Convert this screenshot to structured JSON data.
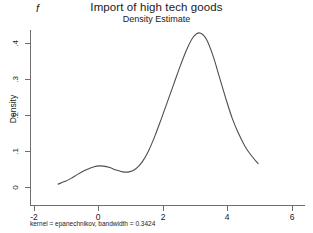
{
  "panel": {
    "letter": "f"
  },
  "titles": {
    "main": "Import of high tech goods",
    "sub": "Density Estimate"
  },
  "note": "kernel = epanechnikov, bandwidth = 0.3424",
  "chart_data": {
    "type": "line",
    "title": "Import of high tech goods",
    "subtitle": "Density Estimate",
    "xlabel": "",
    "ylabel": "Density",
    "xlim": [
      -2.4,
      6.4
    ],
    "ylim": [
      0,
      0.46
    ],
    "xticks": [
      -2,
      0,
      2,
      4,
      6
    ],
    "xticklabels": [
      "-2",
      "0",
      "2",
      "4",
      "6"
    ],
    "yticks": [
      0,
      0.1,
      0.2,
      0.3,
      0.4
    ],
    "yticklabels": [
      "0",
      ".1",
      ".2",
      ".3",
      ".4"
    ],
    "grid": false,
    "legend": false,
    "annotations": [
      "f",
      "kernel = epanechnikov, bandwidth = 0.3424"
    ],
    "series": [
      {
        "name": "Density Estimate",
        "kernel": "epanechnikov",
        "bandwidth": 0.3424,
        "x": [
          -1.25,
          -1.05,
          -0.85,
          -0.65,
          -0.45,
          -0.25,
          -0.05,
          0.15,
          0.35,
          0.55,
          0.75,
          0.95,
          1.15,
          1.35,
          1.55,
          1.75,
          1.95,
          2.15,
          2.35,
          2.55,
          2.75,
          2.95,
          3.15,
          3.35,
          3.55,
          3.75,
          3.95,
          4.15,
          4.35,
          4.55,
          4.75,
          4.95
        ],
        "y": [
          0.008,
          0.015,
          0.024,
          0.035,
          0.045,
          0.053,
          0.058,
          0.058,
          0.054,
          0.047,
          0.042,
          0.042,
          0.05,
          0.069,
          0.1,
          0.142,
          0.19,
          0.24,
          0.29,
          0.34,
          0.385,
          0.418,
          0.428,
          0.41,
          0.365,
          0.305,
          0.245,
          0.19,
          0.147,
          0.112,
          0.086,
          0.065
        ]
      }
    ]
  },
  "axis": {
    "y_ticks": [
      {
        "value": 0.4,
        "label": ".4",
        "top": 43
      },
      {
        "value": 0.3,
        "label": ".3",
        "top": 79
      },
      {
        "value": 0.2,
        "label": ".2",
        "top": 115
      },
      {
        "value": 0.1,
        "label": ".1",
        "top": 151
      },
      {
        "value": 0,
        "label": "0",
        "top": 187
      }
    ],
    "x_ticks": [
      {
        "value": -2,
        "label": "-2",
        "left": 34
      },
      {
        "value": 0,
        "label": "0",
        "left": 98
      },
      {
        "value": 2,
        "label": "2",
        "left": 163
      },
      {
        "value": 4,
        "label": "4",
        "left": 227
      },
      {
        "value": 6,
        "label": "6",
        "left": 292
      }
    ]
  }
}
